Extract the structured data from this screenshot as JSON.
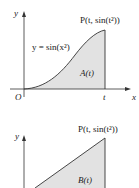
{
  "figures": [
    {
      "id": "top",
      "y_axis_label": "y",
      "x_axis_label": "x",
      "origin_label": "O",
      "t_label": "t",
      "curve_label": "y = sin(x²)",
      "point_label": "P(t, sin(t²))",
      "region_label": "A(t)",
      "colors": {
        "fill": "#e2e2e2",
        "stroke": "#333333"
      }
    },
    {
      "id": "bottom",
      "y_axis_label": "y",
      "point_label": "P(t, sin(t²))",
      "region_label": "B(t)",
      "colors": {
        "fill": "#e2e2e2",
        "stroke": "#333333"
      }
    }
  ]
}
